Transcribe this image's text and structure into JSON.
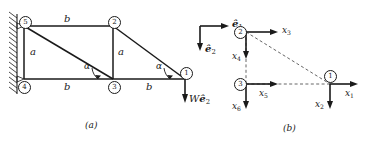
{
  "figure": {
    "panel_a": {
      "caption": "(a)",
      "nodes": [
        {
          "id": "1",
          "label": "1"
        },
        {
          "id": "2",
          "label": "2"
        },
        {
          "id": "3",
          "label": "3"
        },
        {
          "id": "4",
          "label": "4"
        },
        {
          "id": "5",
          "label": "5"
        }
      ],
      "member_labels": {
        "top_chord": "b",
        "left_vertical": "a",
        "mid_vertical": "a",
        "bottom_left": "b",
        "bottom_right": "b"
      },
      "angles": {
        "alpha_left": "α",
        "alpha_right": "α"
      },
      "basis_vectors": {
        "e1_label": "e",
        "e1_sub": "1",
        "e2_label": "e",
        "e2_sub": "2"
      },
      "load": {
        "magnitude": "W",
        "direction_label": "e",
        "direction_sub": "2"
      },
      "support": "fixed-wall-hatched"
    },
    "panel_b": {
      "caption": "(b)",
      "nodes": [
        {
          "id": "1",
          "label": "1"
        },
        {
          "id": "2",
          "label": "2"
        },
        {
          "id": "3",
          "label": "3"
        }
      ],
      "dof_labels": [
        {
          "name": "x1",
          "base": "x",
          "sub": "1"
        },
        {
          "name": "x2",
          "base": "x",
          "sub": "2"
        },
        {
          "name": "x3",
          "base": "x",
          "sub": "3"
        },
        {
          "name": "x4",
          "base": "x",
          "sub": "4"
        },
        {
          "name": "x5",
          "base": "x",
          "sub": "5"
        },
        {
          "name": "x6",
          "base": "x",
          "sub": "6"
        }
      ]
    }
  },
  "colors": {
    "ink": "#1a1a1a",
    "background": "#ffffff",
    "dashed": "#555555"
  }
}
